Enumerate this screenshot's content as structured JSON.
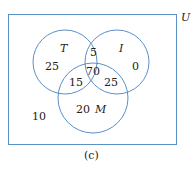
{
  "diagram": {
    "type": "venn-3-set",
    "universe_label": "U",
    "caption": "(c)",
    "line_color": "#5b8fc7",
    "sets": [
      {
        "label": "T"
      },
      {
        "label": "I"
      },
      {
        "label": "M"
      }
    ],
    "regions": {
      "T_only": "25",
      "I_only": "0",
      "M_only": "20",
      "T_and_I_only": "5",
      "T_and_M_only": "15",
      "I_and_M_only": "25",
      "T_and_I_and_M": "70",
      "outside": "10"
    }
  }
}
